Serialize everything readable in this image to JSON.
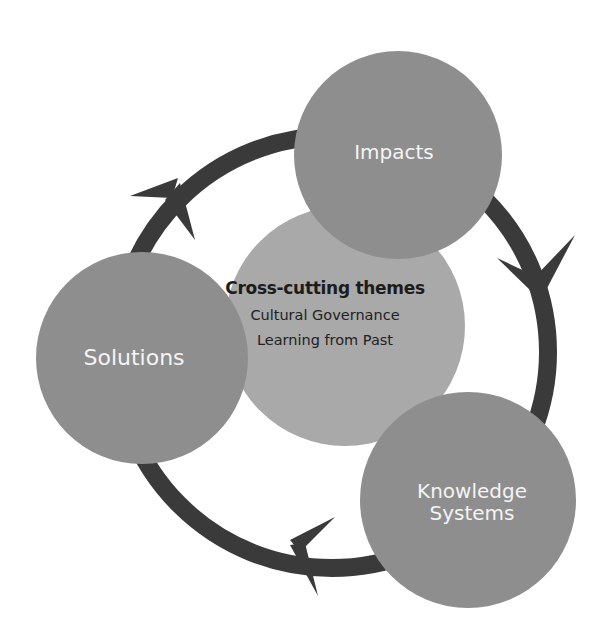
{
  "diagram": {
    "colors": {
      "ring": "#3a3a3a",
      "outer_circle": "#8e8e8e",
      "center_circle": "#a9a9a9",
      "outer_label": "#f4f4f4",
      "center_text": "#1c1c1c",
      "background": "#ffffff"
    },
    "nodes": [
      {
        "id": "impacts",
        "label": "Impacts"
      },
      {
        "id": "knowledge-systems",
        "label_line1": "Knowledge",
        "label_line2": "Systems"
      },
      {
        "id": "solutions",
        "label": "Solutions"
      }
    ],
    "center": {
      "title": "Cross-cutting themes",
      "items": [
        "Cultural Governance",
        "Learning from Past"
      ]
    },
    "cycle_direction": "clockwise",
    "arrows": [
      {
        "from": "solutions",
        "to": "impacts"
      },
      {
        "from": "impacts",
        "to": "knowledge-systems"
      },
      {
        "from": "knowledge-systems",
        "to": "solutions"
      }
    ]
  }
}
